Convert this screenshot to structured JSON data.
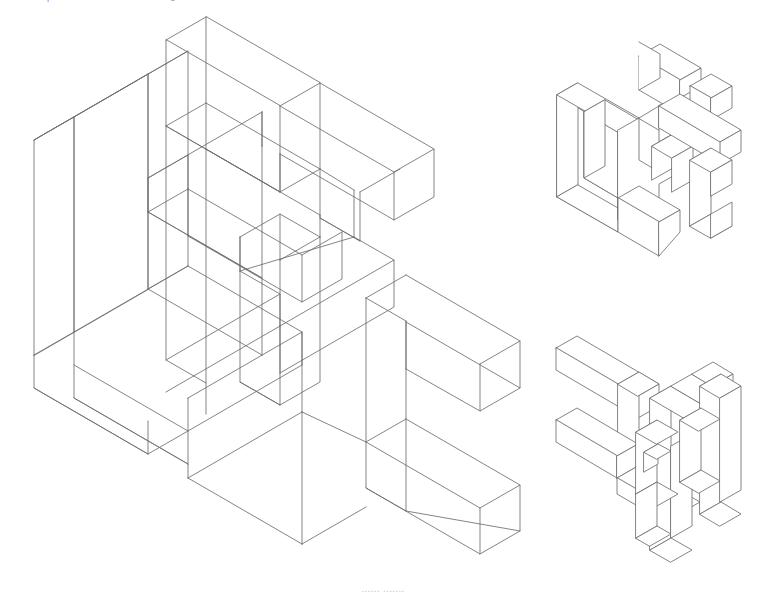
{
  "page": {
    "background_color": "#ffffff",
    "line_color": "#6e6e6e",
    "line_width": 0.85,
    "width": 766,
    "height": 586,
    "content_type": "isometric-technical-illustration"
  },
  "top_cut_text": {
    "visible": true,
    "note": "row of text clipped by the top edge; only descender fragments render",
    "fragments": [
      "—",
      "—,",
      "o"
    ]
  },
  "bottom_cut_text": {
    "visible": true,
    "note": "caption clipped by the bottom edge; illegible",
    "text": "......  ......."
  },
  "figures": [
    {
      "id": "main-wireframe",
      "name": "main-isometric-wireframe",
      "style": "wireframe",
      "label": "",
      "position": {
        "left": 18,
        "top": 22
      },
      "size": {
        "width": 520,
        "height": 540
      },
      "projection": "isometric",
      "iso": {
        "ux": 26,
        "uy": 15,
        "uz": 30
      }
    },
    {
      "id": "top-right-solid",
      "name": "secondary-isometric-solid-upper",
      "style": "solid-opaque",
      "label": "",
      "position": {
        "left": 540,
        "top": 42
      },
      "size": {
        "width": 212,
        "height": 222
      },
      "projection": "isometric",
      "iso": {
        "ux": 11,
        "uy": 6.35,
        "uz": 12.7
      }
    },
    {
      "id": "bottom-right-solid",
      "name": "secondary-isometric-solid-lower",
      "style": "solid-opaque",
      "label": "",
      "position": {
        "left": 540,
        "top": 312
      },
      "size": {
        "width": 212,
        "height": 240
      },
      "projection": "isometric",
      "iso": {
        "ux": 11,
        "uy": 6.35,
        "uz": 12.7
      }
    }
  ]
}
